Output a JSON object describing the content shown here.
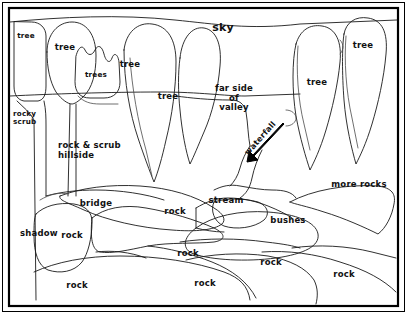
{
  "figure": {
    "kind": "line-drawing-scene-annotation",
    "background_color": "#ffffff",
    "ink_color": "#111111",
    "frame": {
      "outer_border_color": "#000000",
      "inner_border_color": "#000000"
    }
  },
  "labels": {
    "sky": "sky",
    "tree_top_left": "tree",
    "tree_left": "tree",
    "trees_small": "trees",
    "tree_mid": "tree",
    "tree_mid_right": "tree",
    "tree_right": "tree",
    "tree_far_right": "tree",
    "rocky_scrub": "rocky\nscrub",
    "rock_and_scrub_hillside": "rock & scrub\nhillside",
    "far_side_of_valley": "far side\nof\nvalley",
    "waterfall": "waterfall",
    "stream": "stream",
    "bridge": "bridge",
    "shadow": "shadow",
    "bushes": "bushes",
    "more_rocks": "more rocks",
    "rock_bridge_right": "rock",
    "rock_under_shadow": "rock",
    "rock_lower_left": "rock",
    "rock_lower_mid": "rock",
    "rock_mid_right": "rock",
    "rock_lower_right": "rock"
  }
}
